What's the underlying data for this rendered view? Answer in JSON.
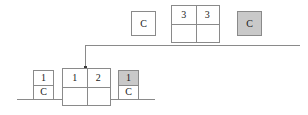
{
  "diagram": {
    "colors": {
      "line": "#8a8a8a",
      "shaded_fill": "#c9c9c9",
      "plain_fill": "#ffffff",
      "text": "#1a1a1a",
      "junction": "#3a3a3a"
    },
    "top_row": {
      "single_box_c": {
        "label": "C",
        "fill": "plain"
      },
      "grid_2x2": {
        "top_left": "3",
        "top_right": "3",
        "bottom_left": "",
        "bottom_right": ""
      },
      "shaded_box_c": {
        "label": "C",
        "fill": "shaded"
      }
    },
    "bottom_row": {
      "stacked_box_left": {
        "top": "1",
        "bottom": "C",
        "top_fill": "plain",
        "bottom_fill": "plain"
      },
      "grid_2x2": {
        "top_left": "1",
        "top_right": "2",
        "bottom_left": "",
        "bottom_right": ""
      },
      "stacked_box_right": {
        "top": "1",
        "bottom": "C",
        "top_fill": "shaded",
        "bottom_fill": "plain"
      }
    },
    "connector": {
      "label": "elbow-connector",
      "junction_marker": ""
    }
  }
}
